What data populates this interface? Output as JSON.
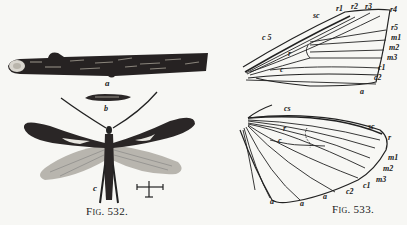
{
  "figures": [
    {
      "caption": "Fig. 532.",
      "parts": {
        "a": "a",
        "b": "b",
        "c": "c"
      },
      "description": "Moth with larva case on twig"
    },
    {
      "caption": "Fig. 533.",
      "forewing_labels": {
        "sc": "sc",
        "r1": "r1",
        "r2": "r2",
        "r3": "r3",
        "r4": "r4",
        "r5": "r5",
        "m1": "m1",
        "m2": "m2",
        "m3": "m3",
        "c1": "c1",
        "c2": "c2",
        "a": "a",
        "c5": "c 5",
        "r": "r",
        "c": "c"
      },
      "hindwing_labels": {
        "cs": "cs",
        "sc": "sc",
        "r_outer": "r",
        "m1": "m1",
        "m2": "m2",
        "m3": "m3",
        "c1": "c1",
        "c2": "c2",
        "a1": "a",
        "a2": "a",
        "a3": "a",
        "r": "r",
        "c": "c"
      }
    }
  ]
}
